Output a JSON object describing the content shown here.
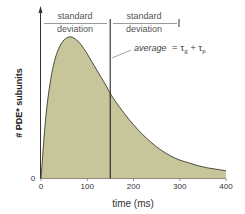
{
  "chart_data": {
    "type": "area",
    "title": "",
    "xlabel": "time (ms)",
    "ylabel": "# PDE* subunits",
    "xlim": [
      0,
      400
    ],
    "x_ticks": [
      "0",
      "100",
      "200",
      "300",
      "400"
    ],
    "y_ticks": [
      "0"
    ],
    "grid": false,
    "series": [
      {
        "name": "PDE* subunits",
        "x": [
          0,
          10,
          20,
          30,
          40,
          50,
          60,
          65,
          70,
          80,
          90,
          100,
          120,
          140,
          150,
          160,
          180,
          200,
          220,
          240,
          260,
          280,
          300,
          320,
          340,
          360,
          380,
          400
        ],
        "values": [
          0,
          0.42,
          0.68,
          0.84,
          0.93,
          0.98,
          1.0,
          1.0,
          0.995,
          0.97,
          0.93,
          0.88,
          0.77,
          0.66,
          0.6,
          0.55,
          0.46,
          0.38,
          0.31,
          0.25,
          0.2,
          0.16,
          0.13,
          0.11,
          0.09,
          0.075,
          0.065,
          0.055
        ],
        "fill_color": "#c6c69a",
        "line_color": "#3a3a2a"
      }
    ],
    "annotations": [
      {
        "type": "vertical-line",
        "x": 150,
        "label": "average = τg + τp"
      },
      {
        "type": "bracket",
        "from": 0,
        "to": 150,
        "label": "standard deviation"
      },
      {
        "type": "bracket",
        "from": 150,
        "to": 300,
        "label": "standard deviation"
      }
    ]
  },
  "labels": {
    "xlabel": "time (ms)",
    "ylabel": "# PDE* subunits",
    "y_zero": "0",
    "x_ticks": [
      "0",
      "100",
      "200",
      "300",
      "400"
    ],
    "sd_left_line1": "standard",
    "sd_left_line2": "deviation",
    "sd_right_line1": "standard",
    "sd_right_line2": "deviation",
    "average_text": "average",
    "average_eq": "= τg + τp"
  },
  "colors": {
    "fill": "#c6c69a",
    "curve": "#3a3a2a",
    "axis": "#333333"
  }
}
